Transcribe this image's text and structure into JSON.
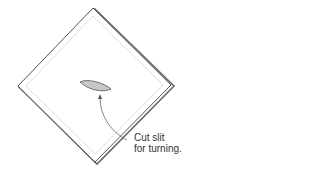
{
  "diagram": {
    "annotation": {
      "line1": "Cut slit",
      "line2": "for turning."
    },
    "colors": {
      "outline": "#555555",
      "shadow_edge": "#6a6a6a",
      "stitch_line": "#9a9a9a",
      "slit_fill": "#c8c8c8",
      "slit_stroke": "#555555",
      "arrow": "#666666",
      "text": "#333333"
    }
  }
}
